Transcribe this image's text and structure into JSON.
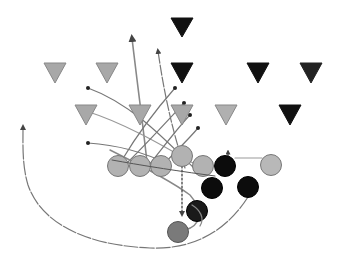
{
  "diagram": {
    "type": "football-play",
    "colors": {
      "background": "#ffffff",
      "defense_light": "#a8a8a8",
      "defense_dark": "#111111",
      "offense_light": "#b2b2b2",
      "offense_dark": "#0c0c0c",
      "offense_back": "#7a7a7a",
      "route": "#777777",
      "route_light": "#a0a0a0",
      "outline": "#6a6a6a"
    },
    "defense": [
      {
        "id": "d1",
        "x": 182,
        "y": 27,
        "shade": "dark"
      },
      {
        "id": "d2",
        "x": 55,
        "y": 72,
        "shade": "light"
      },
      {
        "id": "d3",
        "x": 107,
        "y": 72,
        "shade": "light"
      },
      {
        "id": "d4",
        "x": 182,
        "y": 72,
        "shade": "dark"
      },
      {
        "id": "d5",
        "x": 258,
        "y": 72,
        "shade": "dark"
      },
      {
        "id": "d6",
        "x": 311,
        "y": 72,
        "shade": "dark"
      },
      {
        "id": "d7",
        "x": 86,
        "y": 114,
        "shade": "light"
      },
      {
        "id": "d8",
        "x": 140,
        "y": 114,
        "shade": "light"
      },
      {
        "id": "d9",
        "x": 182,
        "y": 114,
        "shade": "light"
      },
      {
        "id": "d10",
        "x": 226,
        "y": 114,
        "shade": "light"
      },
      {
        "id": "d11",
        "x": 290,
        "y": 114,
        "shade": "dark"
      }
    ],
    "offense": [
      {
        "id": "o1",
        "x": 118,
        "y": 166,
        "shade": "light"
      },
      {
        "id": "o2",
        "x": 140,
        "y": 166,
        "shade": "light"
      },
      {
        "id": "o3",
        "x": 161,
        "y": 166,
        "shade": "light"
      },
      {
        "id": "o4",
        "x": 182,
        "y": 156,
        "shade": "light"
      },
      {
        "id": "o5",
        "x": 203,
        "y": 166,
        "shade": "light"
      },
      {
        "id": "o6",
        "x": 225,
        "y": 166,
        "shade": "dark"
      },
      {
        "id": "o7",
        "x": 271,
        "y": 165,
        "shade": "light"
      },
      {
        "id": "o8",
        "x": 212,
        "y": 188,
        "shade": "dark"
      },
      {
        "id": "o9",
        "x": 248,
        "y": 187,
        "shade": "dark"
      },
      {
        "id": "o10",
        "x": 197,
        "y": 211,
        "shade": "dark"
      },
      {
        "id": "o11",
        "x": 178,
        "y": 232,
        "shade": "back"
      }
    ]
  }
}
